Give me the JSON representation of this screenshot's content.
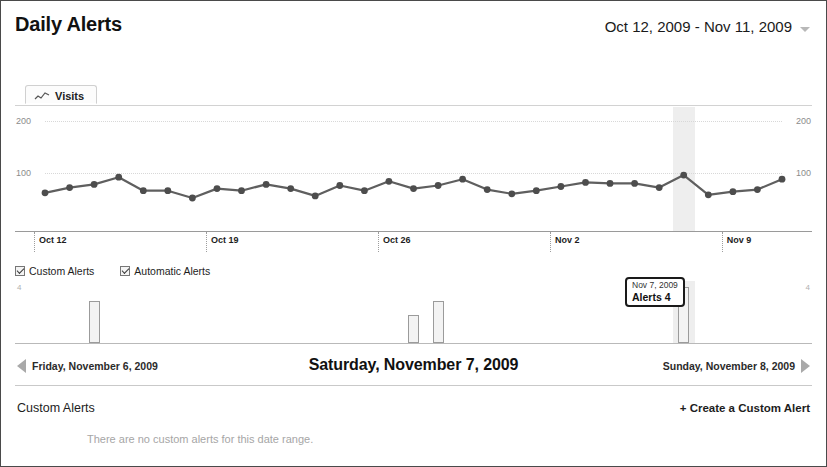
{
  "header": {
    "title": "Daily Alerts",
    "date_range": "Oct 12, 2009 - Nov 11, 2009",
    "caret_icon": "chevron-down-icon"
  },
  "tabs": [
    {
      "label": "Visits",
      "icon": "sparkline-icon",
      "selected": true
    }
  ],
  "legend": {
    "items": [
      {
        "label": "Custom Alerts",
        "checked": true
      },
      {
        "label": "Automatic Alerts",
        "checked": true
      }
    ]
  },
  "tooltip": {
    "date": "Nov 7, 2009",
    "metric_label": "Alerts",
    "value": "4",
    "text": "Alerts 4"
  },
  "day_nav": {
    "prev_label": "Friday, November 6, 2009",
    "current_label": "Saturday, November 7, 2009",
    "next_label": "Sunday, November 8, 2009",
    "prev_icon": "triangle-left-icon",
    "next_icon": "triangle-right-icon"
  },
  "footer": {
    "section_title": "Custom Alerts",
    "create_link": "+ Create a Custom Alert",
    "empty_message": "There are no custom alerts for this date range."
  },
  "colors": {
    "line": "#5f5f5f",
    "marker": "#4d4d4d",
    "bar_fill": "#f3f3f3",
    "bar_stroke": "#9b9b9b",
    "selection_band": "#ebebeb",
    "gridline": "#d8d8d8",
    "axis": "#9a9a9a"
  },
  "chart_data": [
    {
      "type": "line",
      "title": "Visits",
      "xlabel": "",
      "ylabel": "",
      "ylim": [
        0,
        200
      ],
      "yticks": [
        100,
        200
      ],
      "ytick_labels_left": [
        "100",
        "200"
      ],
      "ytick_labels_right": [
        "100",
        "200"
      ],
      "grid": true,
      "legend_position": "none",
      "x": [
        "Oct 12",
        "Oct 13",
        "Oct 14",
        "Oct 15",
        "Oct 16",
        "Oct 17",
        "Oct 18",
        "Oct 19",
        "Oct 20",
        "Oct 21",
        "Oct 22",
        "Oct 23",
        "Oct 24",
        "Oct 25",
        "Oct 26",
        "Oct 27",
        "Oct 28",
        "Oct 29",
        "Oct 30",
        "Oct 31",
        "Nov 1",
        "Nov 2",
        "Nov 3",
        "Nov 4",
        "Nov 5",
        "Nov 6",
        "Nov 7",
        "Nov 8",
        "Nov 9",
        "Nov 10",
        "Nov 11"
      ],
      "xtick_labels": [
        "Oct 12",
        "Oct 19",
        "Oct 26",
        "Nov 2",
        "Nov 9"
      ],
      "xtick_indices": [
        0,
        7,
        14,
        21,
        28
      ],
      "series": [
        {
          "name": "Visits",
          "values": [
            62,
            72,
            78,
            92,
            66,
            66,
            52,
            70,
            66,
            78,
            70,
            56,
            76,
            66,
            84,
            70,
            76,
            88,
            68,
            60,
            66,
            74,
            82,
            80,
            80,
            72,
            96,
            58,
            64,
            68,
            88
          ]
        }
      ],
      "highlight_index": 26,
      "highlight_label": "Nov 7"
    },
    {
      "type": "bar",
      "title": "Alerts",
      "ylim": [
        0,
        4
      ],
      "ytick_labels_left": [
        "4"
      ],
      "ytick_labels_right": [
        "4"
      ],
      "categories": [
        "Oct 12",
        "Oct 13",
        "Oct 14",
        "Oct 15",
        "Oct 16",
        "Oct 17",
        "Oct 18",
        "Oct 19",
        "Oct 20",
        "Oct 21",
        "Oct 22",
        "Oct 23",
        "Oct 24",
        "Oct 25",
        "Oct 26",
        "Oct 27",
        "Oct 28",
        "Oct 29",
        "Oct 30",
        "Oct 31",
        "Nov 1",
        "Nov 2",
        "Nov 3",
        "Nov 4",
        "Nov 5",
        "Nov 6",
        "Nov 7",
        "Nov 8",
        "Nov 9",
        "Nov 10",
        "Nov 11"
      ],
      "values": [
        0,
        0,
        3,
        0,
        0,
        0,
        0,
        0,
        0,
        0,
        0,
        0,
        0,
        0,
        0,
        2,
        3,
        0,
        0,
        0,
        0,
        0,
        0,
        0,
        0,
        0,
        4,
        0,
        0,
        0,
        0
      ],
      "highlight_index": 26
    }
  ]
}
